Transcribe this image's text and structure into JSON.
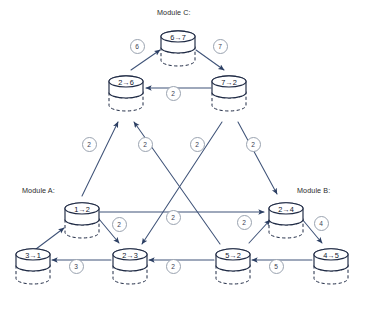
{
  "diagram": {
    "colors": {
      "node_stroke": "#1f2a44",
      "node_fill": "#ffffff",
      "edge_stroke": "#3f5378",
      "label_ring": "#9aa3b0",
      "text": "#10162b",
      "module_text": "#2b2b2b"
    },
    "module_labels": [
      {
        "name": "module-c-label",
        "text": "Module C:",
        "x": 157,
        "y": 8
      },
      {
        "name": "module-a-label",
        "text": "Module A:",
        "x": 22,
        "y": 186
      },
      {
        "name": "module-b-label",
        "text": "Module B:",
        "x": 297,
        "y": 186
      }
    ],
    "nodes": [
      {
        "id": "n67",
        "label": "6→7",
        "cx": 178,
        "cy": 42,
        "module": "C"
      },
      {
        "id": "n26",
        "label": "2→6",
        "cx": 126,
        "cy": 87,
        "module": "C"
      },
      {
        "id": "n72",
        "label": "7→2",
        "cx": 229,
        "cy": 87,
        "module": "C"
      },
      {
        "id": "n12",
        "label": "1→2",
        "cx": 82,
        "cy": 214,
        "module": "A"
      },
      {
        "id": "n24",
        "label": "2→4",
        "cx": 286,
        "cy": 214,
        "module": "B"
      },
      {
        "id": "n31",
        "label": "3→1",
        "cx": 33,
        "cy": 260,
        "module": "A"
      },
      {
        "id": "n23",
        "label": "2→3",
        "cx": 130,
        "cy": 260,
        "module": "A"
      },
      {
        "id": "n52",
        "label": "5→2",
        "cx": 233,
        "cy": 260,
        "module": "B"
      },
      {
        "id": "n45",
        "label": "4→5",
        "cx": 331,
        "cy": 260,
        "module": "B"
      }
    ],
    "edges": [
      {
        "id": "e-26-67",
        "from": "2→6",
        "to": "6→7",
        "label": "6",
        "x1": 131,
        "y1": 70,
        "x2": 160,
        "y2": 50,
        "lx": 136,
        "ly": 45
      },
      {
        "id": "e-67-72",
        "from": "6→7",
        "to": "7→2",
        "label": "7",
        "x1": 196,
        "y1": 50,
        "x2": 224,
        "y2": 70,
        "lx": 219,
        "ly": 45
      },
      {
        "id": "e-72-26",
        "from": "7→2",
        "to": "2→6",
        "label": "2",
        "x1": 211,
        "y1": 88,
        "x2": 146,
        "y2": 88,
        "lx": 172,
        "ly": 92
      },
      {
        "id": "e-12-26",
        "from": "1→2",
        "to": "2→6",
        "label": "2",
        "x1": 82,
        "y1": 196,
        "x2": 118,
        "y2": 122,
        "lx": 88,
        "ly": 143
      },
      {
        "id": "e-52-26",
        "from": "5→2",
        "to": "2→6",
        "label": "2",
        "x1": 220,
        "y1": 244,
        "x2": 134,
        "y2": 122,
        "lx": 144,
        "ly": 143
      },
      {
        "id": "e-72-23",
        "from": "7→2",
        "to": "2→3",
        "label": "2",
        "x1": 222,
        "y1": 122,
        "x2": 142,
        "y2": 244,
        "lx": 196,
        "ly": 143
      },
      {
        "id": "e-72-24",
        "from": "7→2",
        "to": "2→4",
        "label": "2",
        "x1": 238,
        "y1": 122,
        "x2": 277,
        "y2": 194,
        "lx": 252,
        "ly": 143
      },
      {
        "id": "e-12-24",
        "from": "1→2",
        "to": "2→4",
        "label": "2",
        "x1": 100,
        "y1": 212,
        "x2": 264,
        "y2": 212,
        "lx": 172,
        "ly": 216
      },
      {
        "id": "e-12-23",
        "from": "1→2",
        "to": "2→3",
        "label": "2",
        "x1": 99,
        "y1": 219,
        "x2": 119,
        "y2": 243,
        "lx": 118,
        "ly": 223
      },
      {
        "id": "e-52-24",
        "from": "5→2",
        "to": "2→4",
        "label": "2",
        "x1": 249,
        "y1": 243,
        "x2": 270,
        "y2": 220,
        "lx": 243,
        "ly": 221
      },
      {
        "id": "e-24-45",
        "from": "2→4",
        "to": "4→5",
        "label": "4",
        "x1": 302,
        "y1": 219,
        "x2": 322,
        "y2": 243,
        "lx": 320,
        "ly": 222
      },
      {
        "id": "e-23-31",
        "from": "2→3",
        "to": "3→1",
        "label": "3",
        "x1": 111,
        "y1": 260,
        "x2": 52,
        "y2": 260,
        "lx": 75,
        "ly": 265
      },
      {
        "id": "e-52-23",
        "from": "5→2",
        "to": "2→3",
        "label": "2",
        "x1": 214,
        "y1": 260,
        "x2": 149,
        "y2": 260,
        "lx": 172,
        "ly": 265
      },
      {
        "id": "e-45-52",
        "from": "4→5",
        "to": "5→2",
        "label": "5",
        "x1": 312,
        "y1": 260,
        "x2": 252,
        "y2": 260,
        "lx": 275,
        "ly": 265
      },
      {
        "id": "e-12-31",
        "from": "1→2",
        "to": "3→1",
        "label": "",
        "x1": 36,
        "y1": 249,
        "x2": 64,
        "y2": 228,
        "lx": null,
        "ly": null
      }
    ]
  }
}
